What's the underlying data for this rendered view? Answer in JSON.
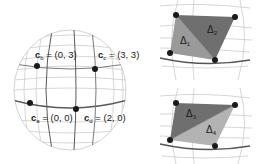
{
  "figure": {
    "type": "sphere-parameterization-diagram",
    "sphere": {
      "points": [
        {
          "id": "b",
          "name": "c",
          "subscript": "b",
          "coords": "(0, 3)",
          "x": 37,
          "y": 66
        },
        {
          "id": "c",
          "name": "c",
          "subscript": "c",
          "coords": "(3, 3)",
          "x": 95,
          "y": 69
        },
        {
          "id": "a",
          "name": "c",
          "subscript": "a",
          "coords": "(0, 0)",
          "x": 30,
          "y": 103
        },
        {
          "id": "d",
          "name": "c",
          "subscript": "d",
          "coords": "(2, 0)",
          "x": 76,
          "y": 109
        }
      ]
    },
    "panels": [
      {
        "id": "top",
        "triangles": [
          {
            "label": "Δ",
            "subscript": "1",
            "shade": "#9a9a9a"
          },
          {
            "label": "Δ",
            "subscript": "2",
            "shade": "#6f6f6f"
          }
        ],
        "diagonal": "top-left to bottom-right"
      },
      {
        "id": "bottom",
        "triangles": [
          {
            "label": "Δ",
            "subscript": "3",
            "shade": "#6f6f6f"
          },
          {
            "label": "Δ",
            "subscript": "4",
            "shade": "#b3b3b3"
          }
        ],
        "diagonal": "bottom-left to top-right"
      }
    ],
    "colors": {
      "grid_light": "#bdbdbd",
      "grid_dark": "#555555",
      "vertex": "#1a1a1a",
      "text": "#222222"
    }
  }
}
